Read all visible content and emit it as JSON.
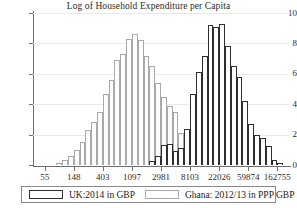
{
  "chart_data": {
    "type": "bar",
    "title": "Log of Household Expenditure per Capita",
    "xlabel": "",
    "ylabel": "",
    "xlim": [
      3.6,
      12.4
    ],
    "ylim": [
      0,
      10
    ],
    "grid": true,
    "x_scale": "log (natural-log bins, tick labels shown as currency amounts)",
    "x_tick_labels": [
      "55",
      "148",
      "403",
      "1097",
      "2981",
      "8103",
      "22026",
      "59874",
      "162755"
    ],
    "x_tick_logvalues": [
      4,
      5,
      6,
      7,
      8,
      9,
      10,
      11,
      12
    ],
    "y_tick_labels": [
      "0",
      "2",
      "4",
      "6",
      "8",
      "10"
    ],
    "y_tick_values": [
      0,
      2,
      4,
      6,
      8,
      10
    ],
    "legend_position": "below-plot",
    "bin_width_log": 0.2,
    "series": [
      {
        "name": "Ghana: 2012/13 in PPP GBP",
        "color": "#a9a9a9",
        "fill": "#fdfdfd",
        "bin_centers_log": [
          4.5,
          4.7,
          4.9,
          5.1,
          5.3,
          5.5,
          5.7,
          5.9,
          6.1,
          6.3,
          6.5,
          6.7,
          6.9,
          7.1,
          7.3,
          7.5,
          7.7,
          7.9,
          8.1,
          8.3,
          8.5,
          8.7,
          8.9,
          9.1,
          9.3,
          9.5
        ],
        "values": [
          0.1,
          0.3,
          0.6,
          1.0,
          1.5,
          2.3,
          2.8,
          3.5,
          4.7,
          5.6,
          6.9,
          7.3,
          8.3,
          8.6,
          8.2,
          7.2,
          6.5,
          5.4,
          4.5,
          3.9,
          3.5,
          2.1,
          1.3,
          0.8,
          0.45,
          0.2
        ]
      },
      {
        "name": "UK:2014 in GBP",
        "color": "#2e2e2e",
        "fill": "#ffffff",
        "bin_centers_log": [
          7.7,
          7.9,
          8.1,
          8.3,
          8.5,
          8.7,
          8.9,
          9.1,
          9.3,
          9.5,
          9.7,
          9.9,
          10.1,
          10.3,
          10.5,
          10.7,
          10.9,
          11.1,
          11.3,
          11.5,
          11.7,
          11.9,
          12.1
        ],
        "values": [
          0.25,
          0.6,
          1.3,
          1.4,
          0.9,
          1.1,
          2.4,
          4.7,
          6.1,
          7.2,
          9.2,
          9.1,
          9.3,
          7.8,
          6.5,
          5.8,
          4.2,
          2.7,
          2.0,
          1.75,
          1.25,
          0.3,
          0.15
        ]
      }
    ]
  },
  "legend": {
    "items": [
      {
        "label": "UK:2014 in GBP",
        "swatch": "uk"
      },
      {
        "label": "Ghana: 2012/13 in PPP GBP",
        "swatch": "ghana"
      }
    ]
  }
}
